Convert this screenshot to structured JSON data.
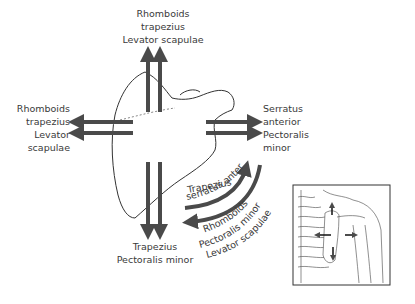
{
  "labels": {
    "top": [
      "Rhomboids",
      "trapezius",
      "Levator scapulae"
    ],
    "left": [
      "Rhomboids",
      "trapezius",
      "Levator",
      "scapulae"
    ],
    "right": [
      "Serratus",
      "anterior",
      "Pectoralis",
      "minor"
    ],
    "bottom": [
      "Trapezius",
      "Pectoralis minor"
    ],
    "arc_inner": [
      "Trapezius",
      "serratus anterior"
    ],
    "arc_outer": [
      "Rhomboids",
      "Pectoralis minor",
      "Levator scapulae"
    ]
  },
  "colors": {
    "arrow": "#4a4a4a",
    "outline": "#333333",
    "text": "#3a3a3a"
  }
}
